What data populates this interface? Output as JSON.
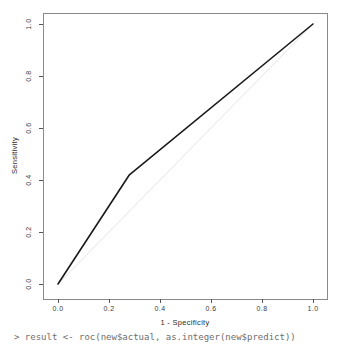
{
  "chart_data": {
    "type": "line",
    "title": "",
    "xlabel": "1 - Specificity",
    "ylabel": "Sensitivity",
    "xlim": [
      0.0,
      1.0
    ],
    "ylim": [
      0.0,
      1.0
    ],
    "x_ticks": [
      "0.0",
      "0.2",
      "0.4",
      "0.6",
      "0.8",
      "1.0"
    ],
    "x_tick_values": [
      0.0,
      0.2,
      0.4,
      0.6,
      0.8,
      1.0
    ],
    "y_ticks": [
      "0.0",
      "0.2",
      "0.4",
      "0.6",
      "0.8",
      "1.0"
    ],
    "y_tick_values": [
      0.0,
      0.2,
      0.4,
      0.6,
      0.8,
      1.0
    ],
    "grid": false,
    "legend": "none",
    "series": [
      {
        "name": "ROC curve",
        "color": "#1a1a1a",
        "width": 1.6,
        "x": [
          0.0,
          0.28,
          1.0
        ],
        "y": [
          0.0,
          0.42,
          1.0
        ]
      },
      {
        "name": "chance reference diagonal",
        "color": "#e4e4e4",
        "width": 1,
        "x": [
          0.0,
          1.0
        ],
        "y": [
          0.0,
          1.0
        ]
      }
    ]
  },
  "console": {
    "line": "> result <- roc(new$actual, as.integer(new$predict))"
  },
  "colors": {
    "box_border": "#8a8a8a",
    "tick_mark": "#555555",
    "background": "#ffffff",
    "console_text": "#6e6e6e"
  }
}
